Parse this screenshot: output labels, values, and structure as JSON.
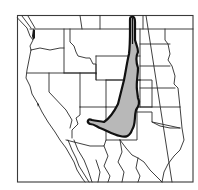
{
  "map": {
    "title": "Distribution range map",
    "region": "Western North America",
    "colors": {
      "background": "#ffffff",
      "border": "#2a2a2a",
      "frame": "#3a3a3a",
      "range_fill": "#b8b8b8",
      "range_outline": "#111111"
    },
    "legend": [],
    "labels": []
  }
}
